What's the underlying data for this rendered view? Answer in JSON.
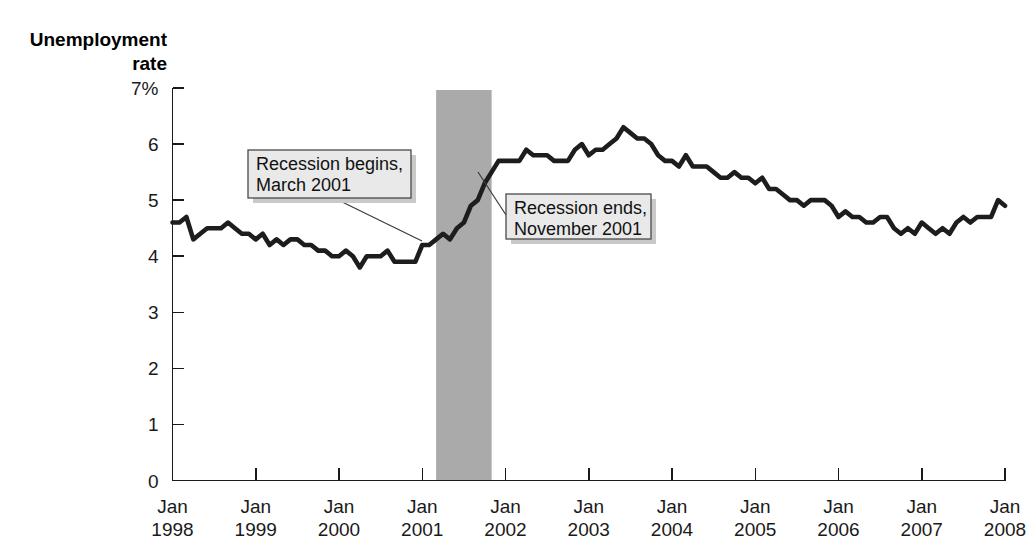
{
  "chart_data": {
    "type": "line",
    "title": "",
    "subtitle": "",
    "ylabel_line1": "Unemployment",
    "ylabel_line2": "rate",
    "xlabel": "",
    "ylim": [
      0,
      7
    ],
    "yticks": [
      0,
      1,
      2,
      3,
      4,
      5,
      6,
      7
    ],
    "ytick_labels": [
      "0",
      "1",
      "2",
      "3",
      "4",
      "5",
      "6",
      "7%"
    ],
    "xlim": [
      "1998-01",
      "2008-01"
    ],
    "xticks": [
      "1998-01",
      "1999-01",
      "2000-01",
      "2001-01",
      "2002-01",
      "2003-01",
      "2004-01",
      "2005-01",
      "2006-01",
      "2007-01",
      "2008-01"
    ],
    "xtick_labels": [
      {
        "month": "Jan",
        "year": "1998"
      },
      {
        "month": "Jan",
        "year": "1999"
      },
      {
        "month": "Jan",
        "year": "2000"
      },
      {
        "month": "Jan",
        "year": "2001"
      },
      {
        "month": "Jan",
        "year": "2002"
      },
      {
        "month": "Jan",
        "year": "2003"
      },
      {
        "month": "Jan",
        "year": "2004"
      },
      {
        "month": "Jan",
        "year": "2005"
      },
      {
        "month": "Jan",
        "year": "2006"
      },
      {
        "month": "Jan",
        "year": "2007"
      },
      {
        "month": "Jan",
        "year": "2008"
      }
    ],
    "grid": false,
    "legend": false,
    "series": [
      {
        "name": "Unemployment rate",
        "color": "#1d1d1d",
        "x": [
          "1998-01",
          "1998-02",
          "1998-03",
          "1998-04",
          "1998-05",
          "1998-06",
          "1998-07",
          "1998-08",
          "1998-09",
          "1998-10",
          "1998-11",
          "1998-12",
          "1999-01",
          "1999-02",
          "1999-03",
          "1999-04",
          "1999-05",
          "1999-06",
          "1999-07",
          "1999-08",
          "1999-09",
          "1999-10",
          "1999-11",
          "1999-12",
          "2000-01",
          "2000-02",
          "2000-03",
          "2000-04",
          "2000-05",
          "2000-06",
          "2000-07",
          "2000-08",
          "2000-09",
          "2000-10",
          "2000-11",
          "2000-12",
          "2001-01",
          "2001-02",
          "2001-03",
          "2001-04",
          "2001-05",
          "2001-06",
          "2001-07",
          "2001-08",
          "2001-09",
          "2001-10",
          "2001-11",
          "2001-12",
          "2002-01",
          "2002-02",
          "2002-03",
          "2002-04",
          "2002-05",
          "2002-06",
          "2002-07",
          "2002-08",
          "2002-09",
          "2002-10",
          "2002-11",
          "2002-12",
          "2003-01",
          "2003-02",
          "2003-03",
          "2003-04",
          "2003-05",
          "2003-06",
          "2003-07",
          "2003-08",
          "2003-09",
          "2003-10",
          "2003-11",
          "2003-12",
          "2004-01",
          "2004-02",
          "2004-03",
          "2004-04",
          "2004-05",
          "2004-06",
          "2004-07",
          "2004-08",
          "2004-09",
          "2004-10",
          "2004-11",
          "2004-12",
          "2005-01",
          "2005-02",
          "2005-03",
          "2005-04",
          "2005-05",
          "2005-06",
          "2005-07",
          "2005-08",
          "2005-09",
          "2005-10",
          "2005-11",
          "2005-12",
          "2006-01",
          "2006-02",
          "2006-03",
          "2006-04",
          "2006-05",
          "2006-06",
          "2006-07",
          "2006-08",
          "2006-09",
          "2006-10",
          "2006-11",
          "2006-12",
          "2007-01",
          "2007-02",
          "2007-03",
          "2007-04",
          "2007-05",
          "2007-06",
          "2007-07",
          "2007-08",
          "2007-09",
          "2007-10",
          "2007-11",
          "2007-12",
          "2008-01"
        ],
        "values": [
          4.6,
          4.6,
          4.7,
          4.3,
          4.4,
          4.5,
          4.5,
          4.5,
          4.6,
          4.5,
          4.4,
          4.4,
          4.3,
          4.4,
          4.2,
          4.3,
          4.2,
          4.3,
          4.3,
          4.2,
          4.2,
          4.1,
          4.1,
          4.0,
          4.0,
          4.1,
          4.0,
          3.8,
          4.0,
          4.0,
          4.0,
          4.1,
          3.9,
          3.9,
          3.9,
          3.9,
          4.2,
          4.2,
          4.3,
          4.4,
          4.3,
          4.5,
          4.6,
          4.9,
          5.0,
          5.3,
          5.5,
          5.7,
          5.7,
          5.7,
          5.7,
          5.9,
          5.8,
          5.8,
          5.8,
          5.7,
          5.7,
          5.7,
          5.9,
          6.0,
          5.8,
          5.9,
          5.9,
          6.0,
          6.1,
          6.3,
          6.2,
          6.1,
          6.1,
          6.0,
          5.8,
          5.7,
          5.7,
          5.6,
          5.8,
          5.6,
          5.6,
          5.6,
          5.5,
          5.4,
          5.4,
          5.5,
          5.4,
          5.4,
          5.3,
          5.4,
          5.2,
          5.2,
          5.1,
          5.0,
          5.0,
          4.9,
          5.0,
          5.0,
          5.0,
          4.9,
          4.7,
          4.8,
          4.7,
          4.7,
          4.6,
          4.6,
          4.7,
          4.7,
          4.5,
          4.4,
          4.5,
          4.4,
          4.6,
          4.5,
          4.4,
          4.5,
          4.4,
          4.6,
          4.7,
          4.6,
          4.7,
          4.7,
          4.7,
          5.0,
          4.9
        ]
      }
    ],
    "shaded_regions": [
      {
        "name": "2001 recession",
        "start": "2001-03",
        "end": "2001-11",
        "color": "#aaaaaa"
      }
    ],
    "annotations": [
      {
        "id": "recession-begins",
        "line1": "Recession begins,",
        "line2": "March 2001",
        "box": {
          "x": 248,
          "y": 150,
          "width": 163,
          "height": 48
        },
        "leader": {
          "x1": 334,
          "y1": 198,
          "x2": 422,
          "y2": 241
        }
      },
      {
        "id": "recession-ends",
        "line1": "Recession ends,",
        "line2": "November 2001",
        "box": {
          "x": 506,
          "y": 194,
          "width": 145,
          "height": 45
        },
        "leader": {
          "x1": 506,
          "y1": 215,
          "x2": 478,
          "y2": 172
        }
      }
    ]
  }
}
